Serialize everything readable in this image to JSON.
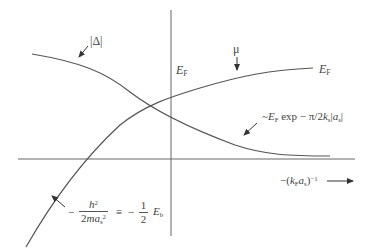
{
  "diagram": {
    "type": "schematic plot of BCS-BEC crossover",
    "axes": {
      "x_label_prefix": "−(",
      "x_label_k": "k",
      "x_label_k_sub": "F",
      "x_label_a": "a",
      "x_label_a_sub": "s",
      "x_label_suffix": ")",
      "x_label_exp": "−1",
      "x_axis_direction_arrow": "right-arrow"
    },
    "curves": {
      "gap": {
        "name": "|Δ|",
        "label": "|Δ|"
      },
      "mu": {
        "name": "μ",
        "label": "μ"
      }
    },
    "labels": {
      "ef_axis": {
        "E": "E",
        "sub": "F"
      },
      "ef_right": {
        "E": "E",
        "sub": "F"
      },
      "gap_asymptote": {
        "prefix": "~",
        "E": "E",
        "E_sub": "F",
        "text": " exp − π/2",
        "k": "k",
        "k_sub": "s",
        "abs_open": "|",
        "a": "a",
        "a_sub": "s",
        "abs_close": "|"
      },
      "binding_energy": {
        "minus": "−",
        "num": "h",
        "num_sup": "2",
        "den_pre": "2",
        "den_m": "m",
        "den_a": "a",
        "den_sub": "s",
        "den_sup": "2",
        "equiv": "≡",
        "minus2": "−",
        "half_num": "1",
        "half_den": "2",
        "E": "E",
        "E_sub": "b"
      }
    },
    "colors": {
      "line": "#555555",
      "text": "#444444",
      "background": "#ffffff"
    }
  }
}
